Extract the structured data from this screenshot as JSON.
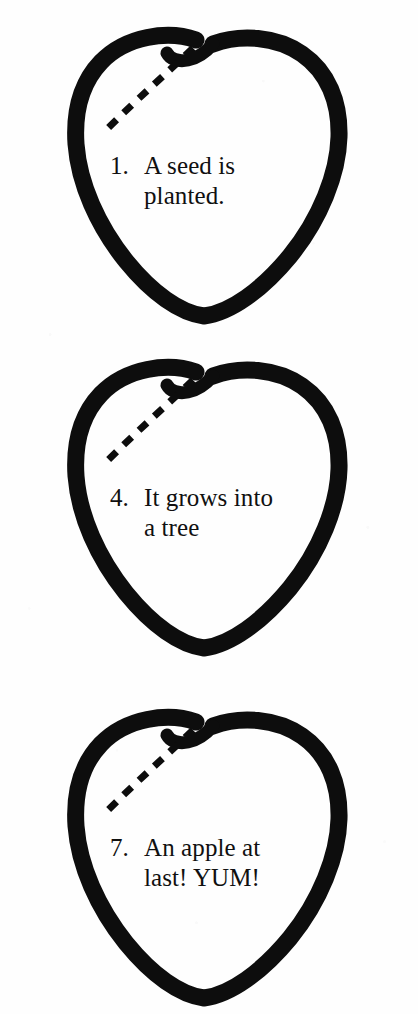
{
  "page": {
    "background_color": "#fefefe",
    "ink_color": "#0d0d0d",
    "text_color": "#101010",
    "width": 418,
    "height": 1014
  },
  "apples": [
    {
      "name": "apple-step-1",
      "number": "1.",
      "line1": "A seed is",
      "line2": "planted.",
      "full_text": "1.  A seed is planted.",
      "outline_icon": "apple-outline-icon",
      "dashed_line_icon": "dashed-guide-line-icon",
      "stem_icon": "apple-stem-icon"
    },
    {
      "name": "apple-step-4",
      "number": "4.",
      "line1": "It grows into",
      "line2": "a tree",
      "full_text": "4.  It grows into a tree",
      "outline_icon": "apple-outline-icon",
      "dashed_line_icon": "dashed-guide-line-icon",
      "stem_icon": "apple-stem-icon"
    },
    {
      "name": "apple-step-7",
      "number": "7.",
      "line1": "An apple at",
      "line2": "last! YUM!",
      "full_text": "7.  An apple at last! YUM!",
      "outline_icon": "apple-outline-icon",
      "dashed_line_icon": "dashed-guide-line-icon",
      "stem_icon": "apple-stem-icon"
    }
  ]
}
